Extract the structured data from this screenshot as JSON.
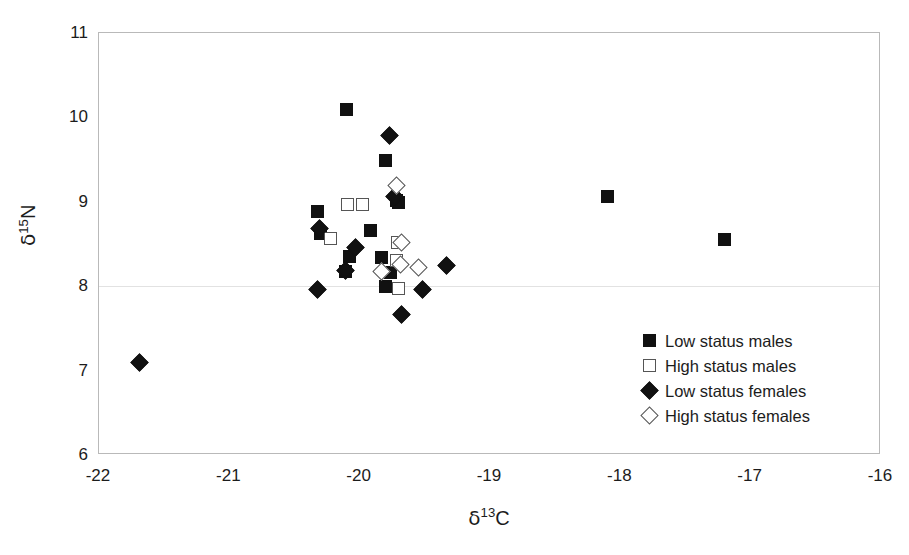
{
  "chart_data": {
    "type": "scatter",
    "title": "",
    "xlabel": "δ 13C",
    "ylabel": "δ 15N",
    "xlim": [
      -22,
      -16
    ],
    "ylim": [
      6,
      11
    ],
    "xticks": [
      "-22",
      "-21",
      "-20",
      "-19",
      "-18",
      "-17",
      "-16"
    ],
    "yticks": [
      "11",
      "10",
      "9",
      "8",
      "7",
      "6"
    ],
    "grid": "single faint horizontal line at y = 8",
    "legend_position": "inside lower-right",
    "series": [
      {
        "name": "Low status males",
        "marker": "filled-square",
        "points": [
          [
            -20.1,
            10.09
          ],
          [
            -19.8,
            9.49
          ],
          [
            -19.72,
            9.02
          ],
          [
            -19.7,
            8.99
          ],
          [
            -20.32,
            8.89
          ],
          [
            -19.92,
            8.66
          ],
          [
            -20.3,
            8.62
          ],
          [
            -20.08,
            8.35
          ],
          [
            -19.83,
            8.34
          ],
          [
            -20.11,
            8.18
          ],
          [
            -19.76,
            8.16
          ],
          [
            -19.8,
            8.0
          ],
          [
            -18.1,
            9.06
          ],
          [
            -17.2,
            8.55
          ]
        ]
      },
      {
        "name": "High status males",
        "marker": "open-square",
        "points": [
          [
            -20.09,
            8.97
          ],
          [
            -19.98,
            8.97
          ],
          [
            -20.22,
            8.56
          ],
          [
            -19.71,
            8.52
          ],
          [
            -19.72,
            8.3
          ],
          [
            -19.7,
            7.97
          ]
        ]
      },
      {
        "name": "Low status females",
        "marker": "filled-diamond",
        "points": [
          [
            -19.77,
            9.78
          ],
          [
            -19.73,
            9.06
          ],
          [
            -20.31,
            8.68
          ],
          [
            -20.03,
            8.46
          ],
          [
            -20.11,
            8.19
          ],
          [
            -19.33,
            8.25
          ],
          [
            -20.32,
            7.96
          ],
          [
            -19.52,
            7.96
          ],
          [
            -19.68,
            7.66
          ],
          [
            -21.69,
            7.1
          ]
        ]
      },
      {
        "name": "High status females",
        "marker": "open-diamond",
        "points": [
          [
            -19.72,
            9.19
          ],
          [
            -19.68,
            8.52
          ],
          [
            -19.69,
            8.26
          ],
          [
            -19.55,
            8.22
          ],
          [
            -19.83,
            8.18
          ]
        ]
      }
    ]
  },
  "legend": {
    "entries": [
      {
        "label": "Low status males",
        "marker": "filled-square"
      },
      {
        "label": "High status males",
        "marker": "open-square"
      },
      {
        "label": "Low status females",
        "marker": "filled-diamond"
      },
      {
        "label": "High status females",
        "marker": "open-diamond"
      }
    ]
  },
  "axes": {
    "x_title_delta": "δ",
    "x_title_sup": "13",
    "x_title_elem": "C",
    "y_title_delta": "δ",
    "y_title_sup": "15",
    "y_title_elem": "N"
  }
}
